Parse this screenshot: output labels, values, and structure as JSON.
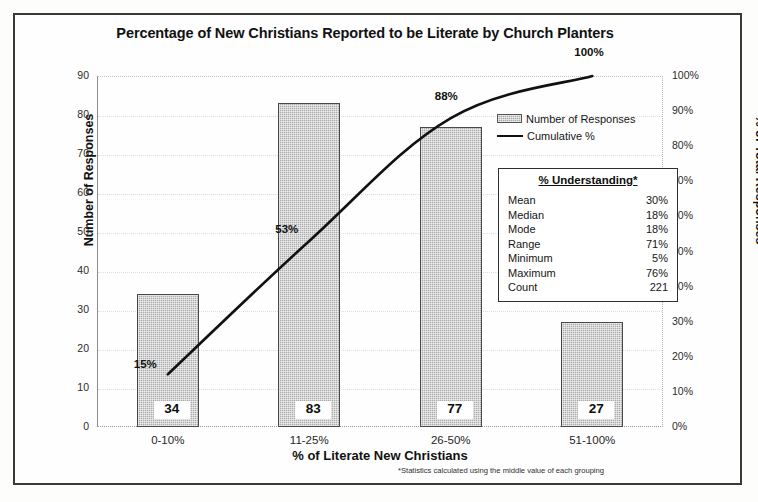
{
  "chart_data": {
    "type": "bar",
    "title": "Percentage of New Christians Reported to be Literate by Church Planters",
    "xlabel": "% of Literate New Christians",
    "ylabel": "Number of Responses",
    "y2label": "% of Total Responses",
    "categories": [
      "0-10%",
      "11-25%",
      "26-50%",
      "51-100%"
    ],
    "series": [
      {
        "name": "Number of Responses",
        "type": "bar",
        "values": [
          34,
          83,
          77,
          27
        ],
        "labels": [
          "34",
          "83",
          "77",
          "27"
        ],
        "axis": "left",
        "color": "#ababab"
      },
      {
        "name": "Cumulative %",
        "type": "line",
        "values": [
          15,
          53,
          88,
          100
        ],
        "labels": [
          "15%",
          "53%",
          "88%",
          "100%"
        ],
        "axis": "right",
        "color": "#111111"
      }
    ],
    "ylim": [
      0,
      90
    ],
    "y2lim": [
      0,
      100
    ],
    "yticks": [
      "90",
      "80",
      "70",
      "60",
      "50",
      "40",
      "30",
      "20",
      "10",
      "0"
    ],
    "y2ticks": [
      "100%",
      "90%",
      "80%",
      "70%",
      "60%",
      "50%",
      "40%",
      "30%",
      "20%",
      "10%",
      "0%"
    ],
    "grid": true,
    "legend_position": "inside-top-right",
    "annotations": [
      "*Statistics calculated using the middle value of each grouping"
    ]
  },
  "title": "Percentage of New Christians Reported to be Literate by Church Planters",
  "axes": {
    "y_left_title": "Number of Responses",
    "y_right_title": "% of Total Responses",
    "x_title": "% of Literate New Christians",
    "y_left_ticks": [
      "90",
      "80",
      "70",
      "60",
      "50",
      "40",
      "30",
      "20",
      "10",
      "0"
    ],
    "y_right_ticks": [
      "100%",
      "90%",
      "80%",
      "70%",
      "60%",
      "50%",
      "40%",
      "30%",
      "20%",
      "10%",
      "0%"
    ],
    "x_ticks": [
      "0-10%",
      "11-25%",
      "26-50%",
      "51-100%"
    ]
  },
  "bars": {
    "values": [
      "34",
      "83",
      "77",
      "27"
    ]
  },
  "cumulative": {
    "labels": [
      "15%",
      "53%",
      "88%",
      "100%"
    ]
  },
  "legend": {
    "bar_label": "Number of Responses",
    "line_label": "Cumulative %"
  },
  "stats": {
    "title": "% Understanding*",
    "rows": [
      {
        "label": "Mean",
        "value": "30%"
      },
      {
        "label": "Median",
        "value": "18%"
      },
      {
        "label": "Mode",
        "value": "18%"
      },
      {
        "label": "Range",
        "value": "71%"
      },
      {
        "label": "Minimum",
        "value": "5%"
      },
      {
        "label": "Maximum",
        "value": "76%"
      },
      {
        "label": "Count",
        "value": "221"
      }
    ]
  },
  "footnote": "*Statistics calculated using the middle value of each grouping"
}
